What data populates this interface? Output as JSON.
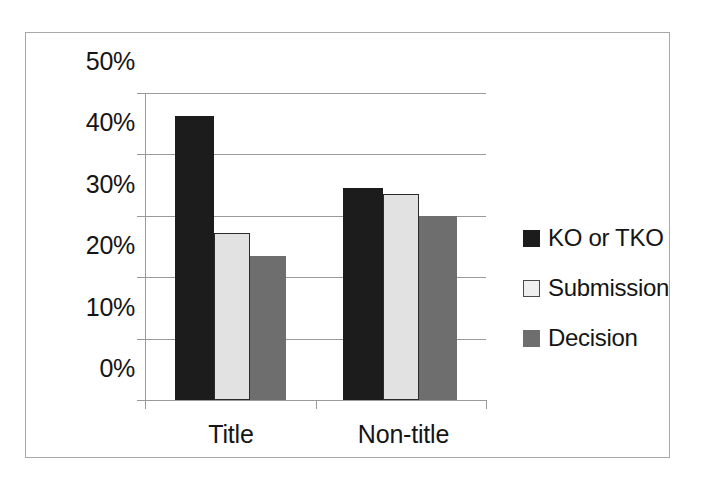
{
  "chart_data": {
    "type": "bar",
    "title": "",
    "subtitle": "",
    "xlabel": "",
    "ylabel": "",
    "categories": [
      "Title",
      "Non-title"
    ],
    "series": [
      {
        "name": "KO or TKO",
        "values": [
          46.3,
          34.6
        ],
        "color": "#1c1c1c"
      },
      {
        "name": "Submission",
        "values": [
          27.2,
          33.5
        ],
        "color": "#e2e2e2"
      },
      {
        "name": "Decision",
        "values": [
          23.4,
          29.9
        ],
        "color": "#6e6e6e"
      }
    ],
    "ylim": [
      0,
      50
    ],
    "ytick_values": [
      0,
      10,
      20,
      30,
      40,
      50
    ],
    "ytick_labels": [
      "0%",
      "10%",
      "20%",
      "30%",
      "40%",
      "50%"
    ],
    "grid": "horizontal",
    "legend_position": "right"
  },
  "axis": {
    "y_labels": [
      "50%",
      "40%",
      "30%",
      "20%",
      "10%",
      "0%"
    ]
  },
  "categories": {
    "first": "Title",
    "second": "Non-title"
  },
  "legend": {
    "items": [
      {
        "label": "KO or TKO"
      },
      {
        "label": "Submission"
      },
      {
        "label": "Decision"
      }
    ]
  }
}
